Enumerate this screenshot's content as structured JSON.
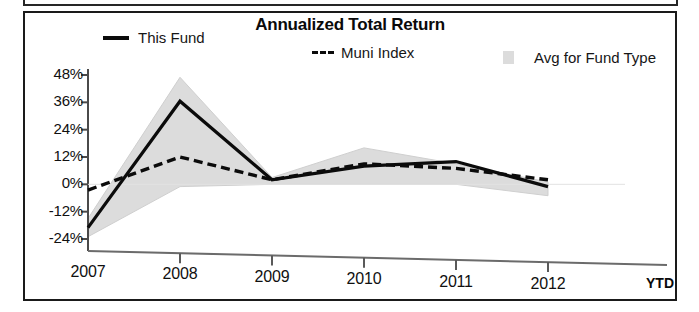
{
  "chart_data": {
    "type": "line",
    "title": "Annualized Total Return",
    "xlabel": "",
    "ylabel": "",
    "x_suffix": "YTD",
    "categories": [
      "2007",
      "2008",
      "2009",
      "2010",
      "2011",
      "2012"
    ],
    "x_tick_labels": [
      "2007",
      "2008",
      "2009",
      "2010",
      "2011",
      "2012"
    ],
    "y_tick_labels": [
      "48%",
      "36%",
      "24%",
      "12%",
      "0%",
      "-12%",
      "-24%"
    ],
    "y_tick_values": [
      48,
      36,
      24,
      12,
      0,
      -12,
      -24
    ],
    "ylim": [
      -24,
      48
    ],
    "grid": false,
    "legend_position": "top",
    "series": [
      {
        "name": "This Fund",
        "style": "solid",
        "color": "#0b0b0b",
        "values": [
          -19,
          36.5,
          2,
          8,
          10,
          -1
        ]
      },
      {
        "name": "Muni Index",
        "style": "dashed",
        "color": "#0b0b0b",
        "values": [
          -2.5,
          12,
          2,
          9,
          7,
          2
        ]
      },
      {
        "name": "Avg for Fund Type",
        "style": "band",
        "color": "#dcdcdc",
        "upper": [
          -15,
          47,
          3,
          16,
          9,
          1
        ],
        "lower": [
          -23,
          -1,
          0,
          0,
          0,
          -5
        ]
      }
    ]
  },
  "legend": {
    "this_fund": "This Fund",
    "muni_index": "Muni Index",
    "avg_for_fund_type": "Avg for Fund Type"
  },
  "icons": {
    "line_solid_swatch": "line-solid-swatch-icon",
    "line_dashed_swatch": "line-dashed-swatch-icon",
    "area_swatch": "area-fill-swatch-icon"
  }
}
